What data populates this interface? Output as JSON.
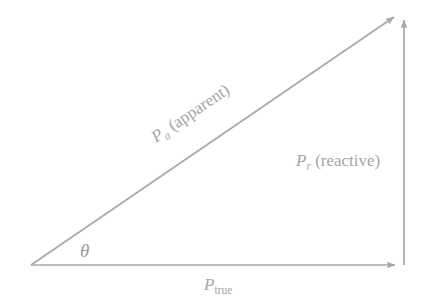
{
  "figure": {
    "background_color": "#ffffff",
    "line_color": "#a8a8a8",
    "text_color": "#a6a6a6"
  },
  "geometry": {
    "origin": {
      "x": 31,
      "y": 265
    },
    "corner_right": {
      "x": 404,
      "y": 265
    },
    "apex": {
      "x": 404,
      "y": 14
    },
    "hypotenuse_tip": {
      "x": 401,
      "y": 13
    },
    "hypotenuse_angle_deg": -34
  },
  "labels": {
    "apparent": {
      "symbol": "P",
      "subscript": "a",
      "text": "(apparent)",
      "full": "P a (apparent)",
      "rotation_deg": -34
    },
    "reactive": {
      "symbol": "P",
      "subscript": "r",
      "text": "(reactive)",
      "full": "P r (reactive)"
    },
    "true_power": {
      "symbol": "P",
      "subscript": "true",
      "full": "P true"
    },
    "angle": {
      "symbol": "θ",
      "name": "theta"
    }
  },
  "vectors": [
    {
      "name": "apparent-power-vector",
      "from": "origin",
      "to": "apex",
      "arrow": true
    },
    {
      "name": "reactive-power-vector",
      "from": "corner_right",
      "to": "apex",
      "arrow": true
    },
    {
      "name": "true-power-vector",
      "from": "origin",
      "to": "corner_right",
      "arrow": true
    }
  ]
}
